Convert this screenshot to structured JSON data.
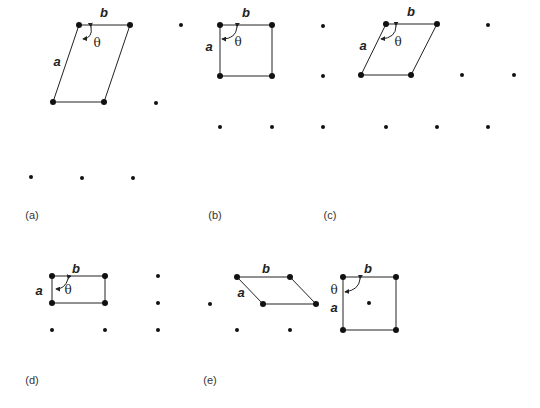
{
  "diagram": {
    "colors": {
      "line": "#222222",
      "point": "#111111",
      "text": "#222222",
      "background": "#ffffff"
    },
    "labels": {
      "vector_a": "a",
      "vector_b": "b",
      "angle": "θ"
    },
    "panels": [
      {
        "id": "a",
        "label": "(a)",
        "type": "oblique",
        "cell": [
          [
            79,
            25
          ],
          [
            130,
            25
          ],
          [
            104,
            102
          ],
          [
            53,
            102
          ]
        ],
        "extra_points": [
          [
            181,
            25
          ],
          [
            156,
            103
          ],
          [
            31,
            177
          ],
          [
            82,
            178
          ],
          [
            133,
            178
          ]
        ],
        "label_pos": {
          "b": [
            104,
            17
          ],
          "a": [
            57,
            66
          ],
          "theta": [
            97,
            47
          ],
          "panel": [
            32,
            219
          ]
        },
        "arc": "M 91 27 Q 93 38 83 39"
      },
      {
        "id": "b",
        "label": "(b)",
        "type": "square",
        "cell": [
          [
            220,
            25
          ],
          [
            272,
            25
          ],
          [
            272,
            76
          ],
          [
            220,
            76
          ]
        ],
        "extra_points": [
          [
            323,
            26
          ],
          [
            323,
            76
          ],
          [
            220,
            127
          ],
          [
            272,
            127
          ],
          [
            323,
            127
          ]
        ],
        "label_pos": {
          "b": [
            246,
            17
          ],
          "a": [
            209,
            51
          ],
          "theta": [
            238,
            46
          ],
          "panel": [
            215,
            219
          ]
        },
        "arc": "M 237 27 Q 236 39 222 39"
      },
      {
        "id": "c",
        "label": "(c)",
        "type": "hexagonal",
        "cell": [
          [
            386,
            24
          ],
          [
            437,
            24
          ],
          [
            411,
            75
          ],
          [
            361,
            75
          ]
        ],
        "extra_points": [
          [
            488,
            25
          ],
          [
            462,
            75
          ],
          [
            514,
            75
          ],
          [
            386,
            127
          ],
          [
            437,
            127
          ],
          [
            488,
            127
          ]
        ],
        "label_pos": {
          "b": [
            411,
            16
          ],
          "a": [
            363,
            50
          ],
          "theta": [
            398,
            46
          ],
          "panel": [
            330,
            219
          ]
        },
        "arc": "M 396 26 Q 396 38 381 39"
      },
      {
        "id": "d",
        "label": "(d)",
        "type": "rectangular",
        "cell": [
          [
            52,
            276
          ],
          [
            105,
            276
          ],
          [
            105,
            303
          ],
          [
            52,
            303
          ]
        ],
        "extra_points": [
          [
            158,
            276
          ],
          [
            158,
            303
          ],
          [
            52,
            330
          ],
          [
            105,
            330
          ],
          [
            158,
            330
          ]
        ],
        "label_pos": {
          "b": [
            76,
            273
          ],
          "a": [
            39,
            295
          ],
          "theta": [
            68,
            294
          ],
          "panel": [
            32,
            384
          ]
        },
        "arc": "M 68 279 Q 65 289 56 289"
      },
      {
        "id": "e",
        "label": "(e)",
        "type": "centered-rectangular",
        "cell": [
          [
            237,
            277
          ],
          [
            290,
            277
          ],
          [
            316,
            304
          ],
          [
            263,
            304
          ]
        ],
        "extra_points": [
          [
            210,
            304
          ],
          [
            237,
            330
          ],
          [
            290,
            330
          ]
        ],
        "label_pos": {
          "b": [
            266,
            273
          ],
          "a": [
            241,
            297
          ],
          "panel": [
            210,
            384
          ]
        },
        "cell2": [
          [
            343,
            277
          ],
          [
            396,
            277
          ],
          [
            396,
            330
          ],
          [
            343,
            330
          ]
        ],
        "cell2_center": [
          369,
          303
        ],
        "cell2_label_pos": {
          "b": [
            368,
            273
          ],
          "a": [
            334,
            312
          ],
          "theta": [
            334,
            294
          ]
        },
        "arc2": "M 360 279 Q 359 290 345 292"
      }
    ]
  }
}
